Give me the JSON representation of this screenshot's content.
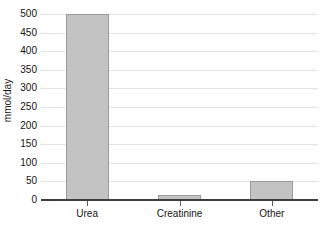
{
  "chart_data": {
    "type": "bar",
    "title": "",
    "xlabel": "",
    "ylabel": "mmol/day",
    "categories": [
      "Urea",
      "Creatinine",
      "Other"
    ],
    "values": [
      500,
      13,
      50
    ],
    "ylim": [
      0,
      500
    ],
    "ytick_step": 50,
    "ytick_labels": [
      "500",
      "450",
      "400",
      "350",
      "300",
      "250",
      "200",
      "150",
      "100",
      "50",
      "0"
    ],
    "ytick_values": [
      500,
      450,
      400,
      350,
      300,
      250,
      200,
      150,
      100,
      50,
      0
    ],
    "grid": "horizontal",
    "legend": "none",
    "series": [
      {
        "name": "Nitrogen excretion",
        "values": [
          500,
          13,
          50
        ]
      }
    ]
  },
  "style": {
    "bar_fill": "#c3c3c3",
    "bar_stroke": "#9a9a9a",
    "gridline_color": "#e3e3e3",
    "axis_color": "#3d3d3d",
    "text_color": "#141414",
    "background": "#ffffff"
  }
}
